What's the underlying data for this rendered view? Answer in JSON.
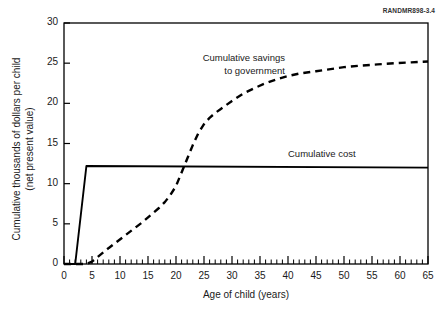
{
  "figure": {
    "id_label": "RANDMR898-3.4",
    "background": "#ffffff",
    "line_color": "#000000"
  },
  "annotations": {
    "savings": "Cumulative savings\nto government",
    "cost": "Cumulative cost"
  },
  "chart_data": {
    "type": "line",
    "title": "",
    "subtitle": "",
    "xlabel": "Age of child (years)",
    "ylabel": "Cumulative thousands of dollars per child\n(net present value)",
    "ylabel_line1": "Cumulative thousands of dollars per child",
    "ylabel_line2": "(net present value)",
    "xlim": [
      0,
      65
    ],
    "ylim": [
      0,
      30
    ],
    "xticks": [
      0,
      5,
      10,
      15,
      20,
      25,
      30,
      35,
      40,
      45,
      50,
      55,
      60,
      65
    ],
    "yticks": [
      0,
      5,
      10,
      15,
      20,
      25,
      30
    ],
    "xminor_tick_step": 1,
    "grid": false,
    "legend": "inline-annotations",
    "legend_position": "in-plot",
    "series": [
      {
        "name": "Cumulative cost",
        "style": "solid",
        "label_text": "Cumulative cost",
        "x": [
          0,
          2,
          4,
          65
        ],
        "values": [
          0,
          0,
          12.2,
          12.0
        ]
      },
      {
        "name": "Cumulative savings to government",
        "style": "dashed",
        "label_text": "Cumulative savings to government",
        "x": [
          0,
          4,
          5,
          8,
          11,
          14,
          17,
          18,
          19,
          20,
          21,
          22,
          23,
          24,
          25,
          26,
          27,
          28,
          29,
          30,
          32,
          34,
          36,
          38,
          40,
          42,
          44,
          45,
          47,
          50,
          53,
          56,
          59,
          62,
          65
        ],
        "values": [
          0,
          0,
          0.3,
          2.0,
          3.6,
          5.2,
          7.0,
          7.7,
          8.6,
          9.7,
          11.4,
          13.1,
          14.8,
          16.3,
          17.4,
          18.2,
          18.8,
          19.3,
          19.8,
          20.3,
          21.2,
          21.9,
          22.5,
          23.0,
          23.4,
          23.7,
          23.9,
          24.0,
          24.2,
          24.5,
          24.7,
          24.85,
          25.0,
          25.1,
          25.2
        ]
      }
    ],
    "crossover_point": {
      "x": 21,
      "y": 12
    }
  }
}
